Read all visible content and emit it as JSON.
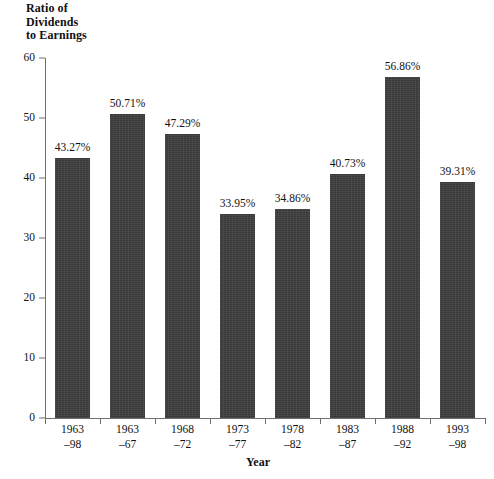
{
  "chart_data": {
    "type": "bar",
    "title": "",
    "ylabel": "Ratio of\nDividends\nto Earnings",
    "ylabel_lines": [
      "Ratio of",
      "Dividends",
      "to Earnings"
    ],
    "xlabel": "Year",
    "ylim": [
      0,
      60
    ],
    "ytick_labels": [
      "0",
      "10",
      "20",
      "30",
      "40",
      "50",
      "60"
    ],
    "ytick_values": [
      0,
      10,
      20,
      30,
      40,
      50,
      60
    ],
    "grid": false,
    "legend": "none",
    "categories": [
      "1963–98",
      "1963–67",
      "1968–72",
      "1973–77",
      "1978–82",
      "1983–87",
      "1988–92",
      "1993–98"
    ],
    "category_lines": [
      {
        "line1": "1963",
        "line2": "–98"
      },
      {
        "line1": "1963",
        "line2": "–67"
      },
      {
        "line1": "1968",
        "line2": "–72"
      },
      {
        "line1": "1973",
        "line2": "–77"
      },
      {
        "line1": "1978",
        "line2": "–82"
      },
      {
        "line1": "1983",
        "line2": "–87"
      },
      {
        "line1": "1988",
        "line2": "–92"
      },
      {
        "line1": "1993",
        "line2": "–98"
      }
    ],
    "values": [
      43.27,
      50.71,
      47.29,
      33.95,
      34.86,
      40.73,
      56.86,
      39.31
    ],
    "value_labels": [
      "43.27%",
      "50.71%",
      "47.29%",
      "33.95%",
      "34.86%",
      "40.73%",
      "56.86%",
      "39.31%"
    ],
    "bar_color": "#3f3f3f",
    "axis_color": "#6f6f6f",
    "text_color": "#111111"
  }
}
